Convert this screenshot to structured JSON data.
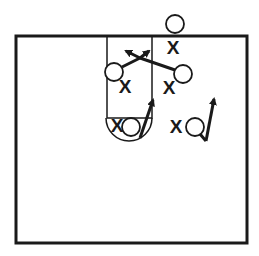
{
  "diagram": {
    "colors": {
      "ink": "#1a1a1a",
      "background": "#ffffff"
    },
    "court": {
      "x": 16,
      "y": 36,
      "width": 231,
      "height": 207
    },
    "lane": {
      "x": 107,
      "y": 36,
      "width": 45,
      "height": 82
    },
    "free_throw_circle": {
      "cx": 129,
      "cy": 118,
      "r": 23
    },
    "offense": [
      {
        "id": "O1",
        "label": "O",
        "cx": 175,
        "cy": 24
      },
      {
        "id": "O2",
        "label": "O",
        "cx": 114,
        "cy": 72
      },
      {
        "id": "O3",
        "label": "O",
        "cx": 183,
        "cy": 74
      },
      {
        "id": "O4",
        "label": "O",
        "cx": 131,
        "cy": 127
      },
      {
        "id": "O5",
        "label": "O",
        "cx": 195,
        "cy": 127
      }
    ],
    "defense": [
      {
        "id": "X1",
        "label": "X",
        "x": 173,
        "y": 47
      },
      {
        "id": "X2",
        "label": "X",
        "x": 125,
        "y": 86
      },
      {
        "id": "X3",
        "label": "X",
        "x": 169,
        "y": 87
      },
      {
        "id": "X4",
        "label": "X",
        "x": 117,
        "y": 125
      },
      {
        "id": "X5",
        "label": "X",
        "x": 176,
        "y": 126
      }
    ]
  }
}
